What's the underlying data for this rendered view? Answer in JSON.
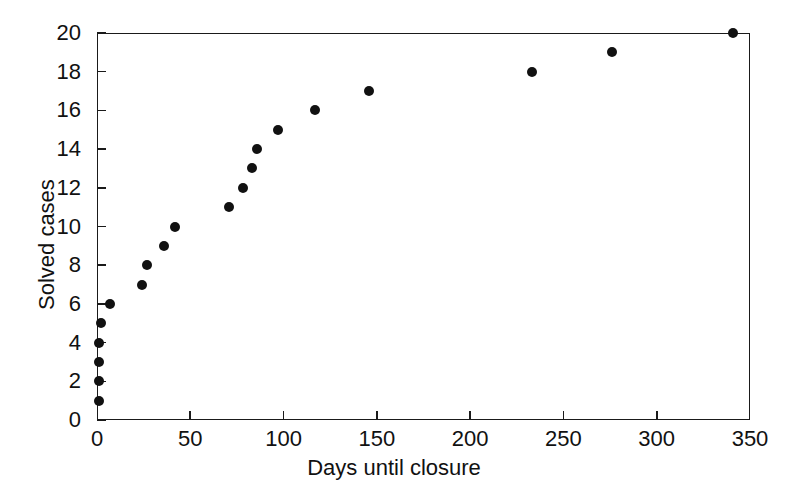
{
  "chart_data": {
    "type": "scatter",
    "title": "",
    "xlabel": "Days until closure",
    "ylabel": "Solved cases",
    "xlim": [
      0,
      350
    ],
    "ylim": [
      0,
      20
    ],
    "xticks": [
      0,
      50,
      100,
      150,
      200,
      250,
      300,
      350
    ],
    "yticks": [
      0,
      2,
      4,
      6,
      8,
      10,
      12,
      14,
      16,
      18,
      20
    ],
    "grid": false,
    "legend": null,
    "marker": "filled-circle",
    "marker_color": "#111111",
    "series": [
      {
        "name": "Solved cases vs days until closure",
        "points": [
          {
            "x": 1,
            "y": 1
          },
          {
            "x": 1,
            "y": 2
          },
          {
            "x": 1,
            "y": 3
          },
          {
            "x": 1,
            "y": 4
          },
          {
            "x": 2,
            "y": 5
          },
          {
            "x": 7,
            "y": 6
          },
          {
            "x": 24,
            "y": 7
          },
          {
            "x": 27,
            "y": 8
          },
          {
            "x": 36,
            "y": 9
          },
          {
            "x": 42,
            "y": 10
          },
          {
            "x": 71,
            "y": 11
          },
          {
            "x": 78,
            "y": 12
          },
          {
            "x": 83,
            "y": 13
          },
          {
            "x": 86,
            "y": 14
          },
          {
            "x": 97,
            "y": 15
          },
          {
            "x": 117,
            "y": 16
          },
          {
            "x": 146,
            "y": 17
          },
          {
            "x": 233,
            "y": 18
          },
          {
            "x": 276,
            "y": 19
          },
          {
            "x": 341,
            "y": 20
          }
        ]
      }
    ]
  },
  "axes": {
    "x_tick_labels": [
      "0",
      "50",
      "100",
      "150",
      "200",
      "250",
      "300",
      "350"
    ],
    "y_tick_labels": [
      "0",
      "2",
      "4",
      "6",
      "8",
      "10",
      "12",
      "14",
      "16",
      "18",
      "20"
    ],
    "x_axis_title": "Days until closure",
    "y_axis_title": "Solved cases"
  }
}
